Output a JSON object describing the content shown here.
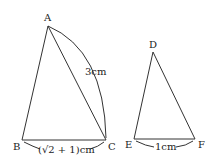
{
  "figure": {
    "triangle_abc": {
      "vertices": {
        "A": "A",
        "B": "B",
        "C": "C"
      },
      "side_ac_label": "3cm",
      "side_bc_label": "(√2 + 1)cm"
    },
    "triangle_def": {
      "vertices": {
        "D": "D",
        "E": "E",
        "F": "F"
      },
      "side_ef_label": "1cm"
    }
  }
}
